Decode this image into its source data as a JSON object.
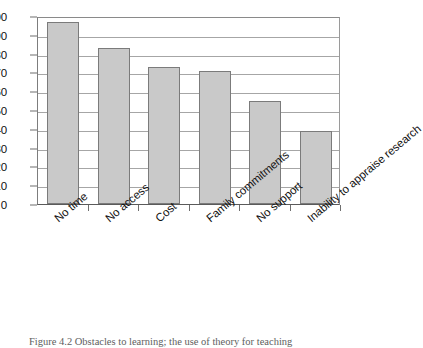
{
  "figure": {
    "caption": "Figure 4.2 Obstacles to learning; the use of theory for teaching",
    "bar_fill_color": "#c9c9c9",
    "bar_border_color": "#7b7b7b",
    "gridline_color": "#a6a6a6"
  },
  "chart_data": {
    "type": "bar",
    "title": "",
    "xlabel": "",
    "ylabel": "",
    "categories": [
      "No time",
      "No access",
      "Cost",
      "Family commitments",
      "No support",
      "Inability to appraise research"
    ],
    "values": [
      97,
      83,
      73,
      71,
      55,
      39
    ],
    "ylim": [
      0,
      100
    ],
    "ytick_labels": [
      "0",
      "10",
      "20",
      "30",
      "40",
      "50",
      "60",
      "70",
      "80",
      "90",
      "100"
    ],
    "ytick_values": [
      0,
      10,
      20,
      30,
      40,
      50,
      60,
      70,
      80,
      90,
      100
    ],
    "grid": true,
    "legend": false
  }
}
